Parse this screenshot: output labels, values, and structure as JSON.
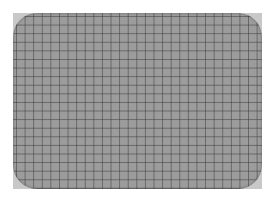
{
  "image": {
    "subject": "grid-paper",
    "description": "Rounded-corner sheet of grid paper on a light gray backing",
    "colors": {
      "background": "#ffffff",
      "backing": "#c8c8c8",
      "sheet": "#9c9c9c",
      "grid_line": "#3c3c3c"
    }
  }
}
